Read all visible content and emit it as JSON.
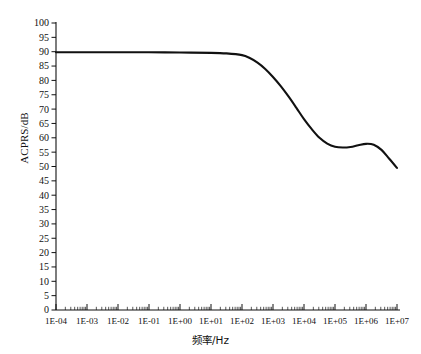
{
  "chart_data": {
    "type": "line",
    "title": "",
    "subtitle": "",
    "xlabel": "频率/Hz",
    "ylabel": "ACPRS/dB",
    "xscale": "log",
    "yscale": "linear",
    "xlim": [
      0.0001,
      10000000
    ],
    "ylim": [
      0,
      100
    ],
    "grid": false,
    "legend": null,
    "legend_position": "none",
    "line_color": "#111111",
    "background_color": "#ffffff",
    "x_tick_labels": [
      "1E-04",
      "1E-03",
      "1E-02",
      "1E-01",
      "1E+00",
      "1E+01",
      "1E+02",
      "1E+03",
      "1E+04",
      "1E+05",
      "1E+06",
      "1E+07"
    ],
    "x_tick_values": [
      0.0001,
      0.001,
      0.01,
      0.1,
      1,
      10,
      100,
      1000,
      10000,
      100000,
      1000000,
      10000000
    ],
    "y_tick_labels": [
      "0",
      "5",
      "10",
      "15",
      "20",
      "25",
      "30",
      "35",
      "40",
      "45",
      "50",
      "55",
      "60",
      "65",
      "70",
      "75",
      "80",
      "85",
      "90",
      "95",
      "100"
    ],
    "y_tick_values": [
      0,
      5,
      10,
      15,
      20,
      25,
      30,
      35,
      40,
      45,
      50,
      55,
      60,
      65,
      70,
      75,
      80,
      85,
      90,
      95,
      100
    ],
    "series": [
      {
        "name": "ACPRS",
        "x": [
          0.0001,
          0.001,
          0.01,
          0.1,
          1,
          10,
          31.6,
          100,
          178,
          316,
          562,
          1000,
          1780,
          3160,
          5620,
          10000,
          17800,
          31600,
          56200,
          100000,
          178000,
          316000,
          562000,
          1000000,
          1780000,
          3160000,
          5620000,
          10000000
        ],
        "y": [
          89.8,
          89.8,
          89.8,
          89.8,
          89.7,
          89.6,
          89.4,
          88.8,
          87.8,
          86.2,
          84.0,
          81.2,
          78.0,
          74.4,
          70.5,
          66.5,
          63.0,
          60.0,
          58.0,
          56.9,
          56.6,
          56.8,
          57.4,
          57.9,
          57.6,
          55.8,
          52.7,
          49.5
        ]
      }
    ],
    "annotations": []
  }
}
